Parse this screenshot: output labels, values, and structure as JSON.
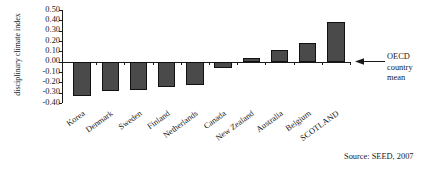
{
  "chart_data": {
    "type": "bar",
    "title": "",
    "xlabel": "",
    "ylabel": "disciplinary climate index",
    "categories": [
      "Korea",
      "Denmark",
      "Sweden",
      "Finland",
      "Netherlands",
      "Canada",
      "New Zealand",
      "Australia",
      "Belgium",
      "SCOTLAND"
    ],
    "values": [
      -0.33,
      -0.28,
      -0.27,
      -0.25,
      -0.23,
      -0.06,
      0.04,
      0.11,
      0.18,
      0.38
    ],
    "ylim": [
      -0.4,
      0.5
    ],
    "ytick_labels": [
      "0.50",
      "0.40",
      "0.30",
      "0.20",
      "0.10",
      "0.00",
      "-0.10",
      "-0.20",
      "-0.30",
      "-0.40"
    ],
    "ytick_values": [
      0.5,
      0.4,
      0.3,
      0.2,
      0.1,
      0.0,
      -0.1,
      -0.2,
      -0.3,
      -0.4
    ],
    "grid": false,
    "legend": "none",
    "bar_color": "#4a4a4a",
    "bar_border_color": "#111111",
    "axis_color": "#1a1a1a",
    "annotations": [
      {
        "name": "oecd-country-mean",
        "text_lines": [
          "OECD",
          "country",
          "mean"
        ],
        "points_to_value": 0.0,
        "arrow_direction": "left"
      }
    ],
    "source": "Source: SEED, 2007"
  }
}
